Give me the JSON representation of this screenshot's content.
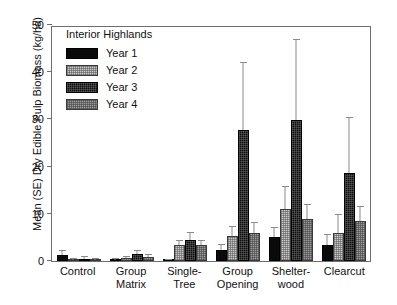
{
  "chart_data": {
    "type": "bar",
    "title": "",
    "annotation": "Interior Highlands",
    "xlabel": "",
    "ylabel": "Mean (SE) Dry Edible Pulp Biomass (kg/ha)",
    "ylim": [
      0,
      50
    ],
    "yticks": [
      0,
      10,
      20,
      30,
      40,
      50
    ],
    "ytick_labels": [
      "0",
      "10",
      "20",
      "30",
      "40",
      "50"
    ],
    "grid": false,
    "legend_position": "upper-left-inside",
    "categories": [
      "Control",
      "Group Matrix",
      "Single-Tree",
      "Group Opening",
      "Shelter-wood",
      "Clearcut"
    ],
    "category_lines": [
      [
        "Control"
      ],
      [
        "Group",
        "Matrix"
      ],
      [
        "Single-",
        "Tree"
      ],
      [
        "Group",
        "Opening"
      ],
      [
        "Shelter-",
        "wood"
      ],
      [
        "Clearcut"
      ]
    ],
    "series": [
      {
        "name": "Year 1",
        "fill": "solid-black",
        "color": "#0a0a0a",
        "values": [
          1.3,
          0.3,
          0.2,
          2.3,
          5.0,
          3.4
        ],
        "errors": [
          1.0,
          0.4,
          0.2,
          1.4,
          2.3,
          2.4
        ]
      },
      {
        "name": "Year 2",
        "fill": "light-gray-stipple",
        "color": "#c9c9c9",
        "values": [
          0.2,
          0.6,
          3.4,
          5.4,
          11.0,
          6.0
        ],
        "errors": [
          0.3,
          0.5,
          1.0,
          2.0,
          5.0,
          4.0
        ]
      },
      {
        "name": "Year 3",
        "fill": "dark-checkered",
        "color": "#0d0d0d",
        "values": [
          0.5,
          1.5,
          4.5,
          27.8,
          29.8,
          18.6
        ],
        "errors": [
          0.5,
          0.8,
          1.6,
          14.4,
          17.2,
          12.0
        ]
      },
      {
        "name": "Year 4",
        "fill": "medium-gray-stipple",
        "color": "#9a9a9a",
        "values": [
          0.3,
          0.9,
          3.4,
          6.0,
          8.8,
          8.5
        ],
        "errors": [
          0.3,
          0.5,
          1.0,
          2.2,
          3.2,
          3.2
        ]
      }
    ]
  }
}
